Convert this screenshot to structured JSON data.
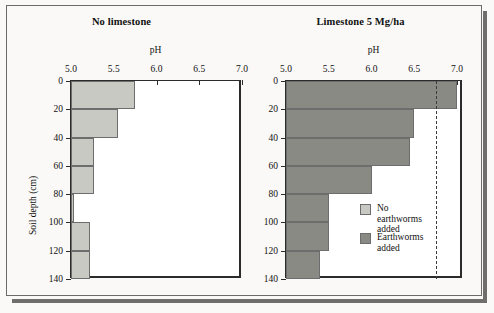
{
  "figure": {
    "background_color": "#faf9f7",
    "frame_color": "#6b6b6b"
  },
  "panels": [
    {
      "id": "no-limestone",
      "title": "No limestone",
      "xlabel": "pH",
      "ylabel": "Soil depth (cm)"
    },
    {
      "id": "limestone",
      "title": "Limestone 5 Mg/ha",
      "xlabel": "pH",
      "ylabel": ""
    }
  ],
  "axes": {
    "x_ticks": [
      "5.0",
      "5.5",
      "6.0",
      "6.5",
      "7.0"
    ],
    "x_tick_values": [
      5.0,
      5.5,
      6.0,
      6.5,
      7.0
    ],
    "y_ticks": [
      "0",
      "20",
      "40",
      "60",
      "80",
      "100",
      "120",
      "140"
    ],
    "y_tick_values": [
      0,
      20,
      40,
      60,
      80,
      100,
      120,
      140
    ],
    "xlim": [
      5.0,
      7.0
    ],
    "ylim": [
      0,
      140
    ]
  },
  "legend": {
    "position": "inside-right-panel-lower-right",
    "items": [
      {
        "label": "No earthworms\nadded",
        "color": "#c9c9c4"
      },
      {
        "label": "Earthworms\nadded",
        "color": "#8a8a85"
      }
    ]
  },
  "colors": {
    "no_earthworms": "#c9c9c4",
    "earthworms": "#8a8a85",
    "axis": "#2b2b2b",
    "bar_outline": "#6d6d6d"
  },
  "chart_data": {
    "type": "bar",
    "orientation": "horizontal",
    "xlabel": "pH",
    "ylabel": "Soil depth (cm)",
    "xlim": [
      5.0,
      7.0
    ],
    "ylim": [
      0,
      140
    ],
    "grid": false,
    "legend_position": "lower right of second panel",
    "depth_intervals_cm": [
      [
        0,
        20
      ],
      [
        20,
        40
      ],
      [
        40,
        60
      ],
      [
        60,
        80
      ],
      [
        80,
        100
      ],
      [
        100,
        120
      ],
      [
        120,
        140
      ]
    ],
    "panels": [
      {
        "title": "No limestone",
        "series": [
          {
            "name": "No earthworms added",
            "color": "#c9c9c4",
            "values": [
              5.75,
              5.55,
              5.27,
              5.27,
              5.04,
              5.22,
              5.22
            ]
          }
        ]
      },
      {
        "title": "Limestone 5 Mg/ha",
        "reference_line": {
          "value": 6.75,
          "style": "dashed"
        },
        "series": [
          {
            "name": "No earthworms added",
            "color": "#c9c9c4",
            "values": [
              7.0,
              6.45,
              5.5,
              5.3,
              5.3,
              5.3,
              5.1
            ]
          },
          {
            "name": "Earthworms added",
            "color": "#8a8a85",
            "values": [
              7.0,
              6.5,
              6.45,
              6.0,
              5.5,
              5.5,
              5.4
            ]
          }
        ]
      }
    ]
  }
}
